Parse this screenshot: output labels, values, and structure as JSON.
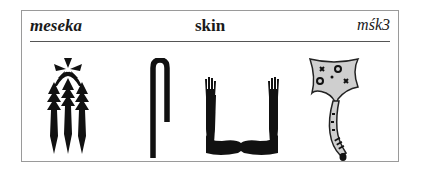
{
  "entry": {
    "transliteration": "meseka",
    "meaning": "skin",
    "code": "mśk3"
  },
  "glyphs": [
    {
      "name": "fox-skins-hieroglyph"
    },
    {
      "name": "shepherds-crook-hieroglyph"
    },
    {
      "name": "arms-hieroglyph"
    },
    {
      "name": "animal-hide-with-tail-hieroglyph"
    }
  ],
  "colors": {
    "ink": "#111111",
    "frame": "#9a9a9a",
    "rule": "#555555",
    "hide_fill": "#cfcfcf"
  }
}
